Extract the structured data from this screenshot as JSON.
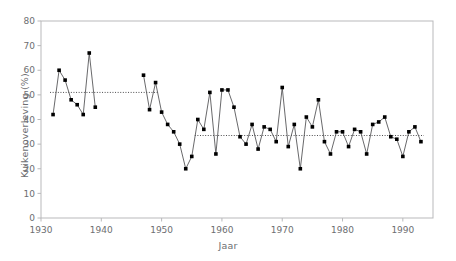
{
  "chart_data": {
    "type": "line",
    "title": "",
    "subtitle": "",
    "xlabel": "Jaar",
    "ylabel": "Kuikenoverleving (%)",
    "xlim": [
      1930,
      1995
    ],
    "ylim": [
      0,
      80
    ],
    "xticks": [
      1930,
      1940,
      1950,
      1960,
      1970,
      1980,
      1990
    ],
    "yticks": [
      0,
      10,
      20,
      30,
      40,
      50,
      60,
      70,
      80
    ],
    "xtick_labels": [
      "1930",
      "1940",
      "1950",
      "1960",
      "1970",
      "1980",
      "1990"
    ],
    "ytick_labels": [
      "0",
      "10",
      "20",
      "30",
      "40",
      "50",
      "60",
      "70",
      "80"
    ],
    "grid": false,
    "legend": "none",
    "marker": "filled-square",
    "marker_color": "#000000",
    "line_color": "#58585a",
    "frame_color": "#b9b9bb",
    "series": [
      {
        "name": "Kuikenoverleving",
        "x": [
          1932,
          1933,
          1934,
          1935,
          1936,
          1937,
          1938,
          1939,
          1947,
          1948,
          1949,
          1950,
          1951,
          1952,
          1953,
          1954,
          1955,
          1956,
          1957,
          1958,
          1959,
          1960,
          1961,
          1962,
          1963,
          1964,
          1965,
          1966,
          1967,
          1968,
          1969,
          1970,
          1971,
          1972,
          1973,
          1974,
          1975,
          1976,
          1977,
          1978,
          1979,
          1980,
          1981,
          1982,
          1983,
          1984,
          1985,
          1986,
          1987,
          1988,
          1989,
          1990,
          1991,
          1992,
          1993
        ],
        "values": [
          42,
          60,
          56,
          48,
          46,
          42,
          67,
          45,
          58,
          44,
          55,
          43,
          38,
          35,
          30,
          20,
          25,
          40,
          36,
          51,
          26,
          52,
          52,
          45,
          33,
          30,
          38,
          28,
          37,
          36,
          31,
          53,
          29,
          38,
          20,
          41,
          37,
          48,
          31,
          26,
          35,
          35,
          29,
          36,
          35,
          26,
          38,
          39,
          41,
          33,
          32,
          25,
          35,
          37,
          31
        ]
      }
    ],
    "reference_lines": [
      {
        "name": "mean-1932-1949",
        "y": 51,
        "x_start": 1931.5,
        "x_end": 1949.5,
        "style": "dotted"
      },
      {
        "name": "mean-1956-1993",
        "y": 33.5,
        "x_start": 1955.5,
        "x_end": 1993.5,
        "style": "dotted"
      }
    ]
  }
}
